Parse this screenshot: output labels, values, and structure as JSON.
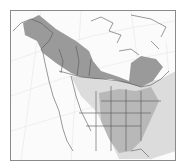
{
  "map": {
    "type": "species-range-map",
    "region": "North America",
    "colors": {
      "background": "#fbfbfb",
      "frame": "#8a8a8a",
      "graticule": "#e6e6e6",
      "land_outline": "#555555",
      "range_dark": "#9a9a9a",
      "range_medium": "#b8b8b8",
      "range_light": "#dcdcdc"
    },
    "legend": []
  }
}
